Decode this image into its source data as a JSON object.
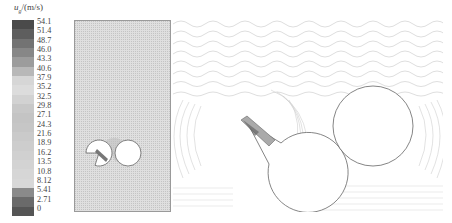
{
  "legend": {
    "symbol": "u",
    "subscript": "g",
    "unit": "/(m/s)",
    "ticks": [
      "54.1",
      "51.4",
      "48.7",
      "46.0",
      "43.3",
      "40.6",
      "37.9",
      "35.2",
      "32.5",
      "29.8",
      "27.1",
      "24.3",
      "21.6",
      "18.9",
      "16.2",
      "13.5",
      "10.8",
      "8.12",
      "5.41",
      "2.71",
      "0"
    ],
    "band_colors": [
      "#4a4a4a",
      "#5e5e5e",
      "#737373",
      "#878787",
      "#9c9c9c",
      "#b8b8b8",
      "#d6d6d6",
      "#dcdcdc",
      "#d2d2d2",
      "#c8c8c8",
      "#c4c4c4",
      "#c6c6c6",
      "#cacaca",
      "#cdcdcd",
      "#d0d0d0",
      "#d3d3d3",
      "#d6d6d6",
      "#d8d8d8",
      "#8a8a8a",
      "#6a6a6a",
      "#555555"
    ]
  },
  "panels": {
    "left": {
      "description": "overall gas velocity field with two cylinders"
    },
    "right": {
      "description": "enlarged vector field around two cylinders"
    }
  }
}
